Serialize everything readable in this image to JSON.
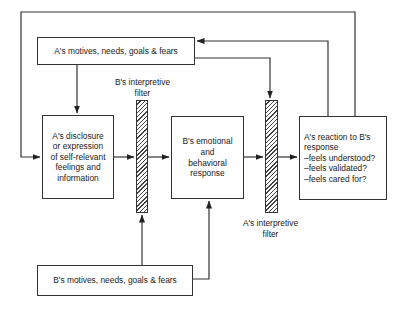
{
  "diagram": {
    "type": "flow",
    "nodes": {
      "a_motives": {
        "label": "A's motives, needs, goals & fears"
      },
      "a_disclosure": {
        "lines": [
          "A's disclosure",
          "or expression",
          "of self-relevant",
          "feelings and",
          "information"
        ]
      },
      "b_response": {
        "lines": [
          "B's emotional",
          "and",
          "behavioral",
          "response"
        ]
      },
      "a_reaction": {
        "lines": [
          "A's reaction to B's",
          "response",
          "–feels understood?",
          "–feels validated?",
          "–feels cared for?"
        ]
      },
      "b_motives": {
        "label": "B's motives, needs, goals & fears"
      }
    },
    "filters": {
      "b_filter": {
        "lines": [
          "B's interpretive",
          "filter"
        ]
      },
      "a_filter": {
        "lines": [
          "A's interpretive",
          "filter"
        ]
      }
    },
    "edges": [
      {
        "from": "a_motives",
        "to": "a_disclosure"
      },
      {
        "from": "a_motives",
        "to": "a_filter"
      },
      {
        "from": "a_disclosure",
        "to": "b_filter"
      },
      {
        "from": "b_filter",
        "to": "b_response"
      },
      {
        "from": "b_response",
        "to": "a_filter"
      },
      {
        "from": "a_filter",
        "to": "a_reaction"
      },
      {
        "from": "a_reaction",
        "to": "a_motives"
      },
      {
        "from": "a_reaction",
        "to": "a_disclosure"
      },
      {
        "from": "b_motives",
        "to": "b_filter"
      },
      {
        "from": "b_motives",
        "to": "b_response"
      }
    ]
  }
}
